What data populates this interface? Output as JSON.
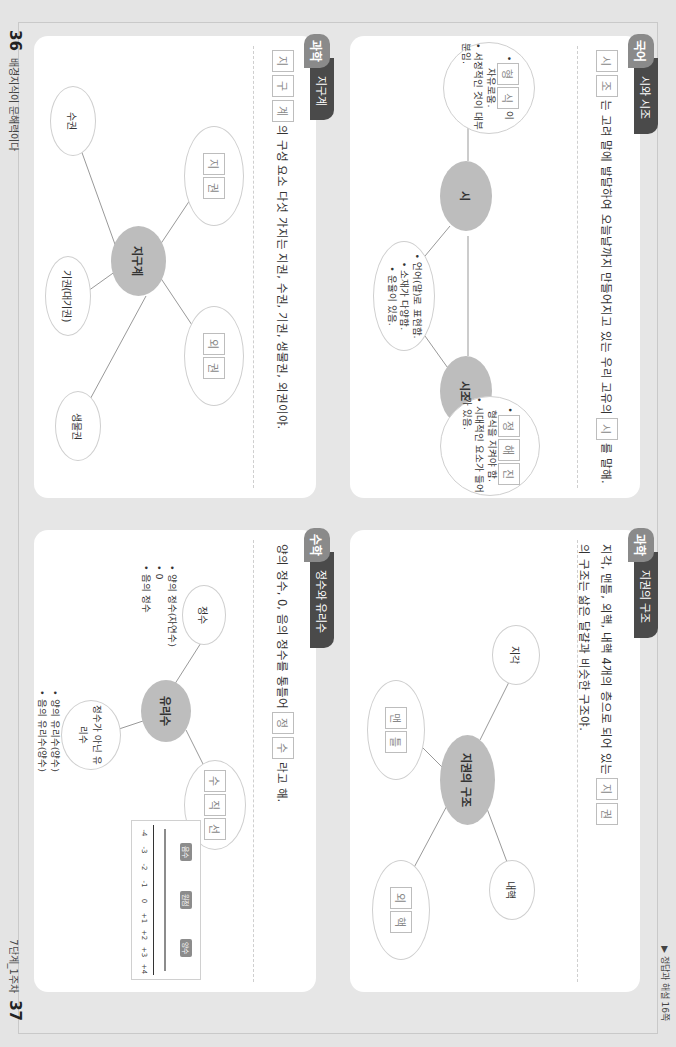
{
  "header": {
    "answer_ref": "▶ 정답과 해설 16쪽"
  },
  "footer": {
    "left_page_number": "36",
    "left_book_title": "배경지식이 문해력이다",
    "right_page_number": "37",
    "right_unit": "7단계_1주차"
  },
  "colors": {
    "korean_tab": "#8a8a8a",
    "science_tab": "#8a8a8a",
    "math_tab": "#8a8a8a",
    "title_tab": "#4a4a4a",
    "hub_fill": "#bdbdbd",
    "page_bg": "#e6e6e6"
  },
  "cards": {
    "poetry": {
      "subject": "국어",
      "title": "시와 시조",
      "prompt_boxes_pre": [
        "시",
        "조"
      ],
      "prompt_text_1": "는 고려 말에 발달하여 오늘날까지 만들어지고 있는 우리 고유의",
      "prompt_boxes_mid": [
        "시"
      ],
      "prompt_text_2": "를 말해.",
      "hubs": [
        "시",
        "시조"
      ],
      "poem_node": {
        "boxes": [
          "형",
          "식"
        ],
        "suffix": "이",
        "line1": "자유로움.",
        "line2": "• 서정적인 것이 대부분임."
      },
      "shared_node": {
        "line1": "• 언어(말)로 표현함.",
        "line2": "• 소재가 다양함.",
        "line3": "• 운율이 있음."
      },
      "sijo_node": {
        "boxes": [
          "정",
          "해",
          "진"
        ],
        "line1": "형식을 지켜야 함.",
        "line2": "• 시대적인 요소가 들어가 있음."
      }
    },
    "earth_system": {
      "subject": "과학",
      "title": "지구계",
      "prompt_boxes": [
        "지",
        "구",
        "계"
      ],
      "prompt_text": "의 구성 요소 다섯 가지는 지권, 수권, 기권, 생물권, 외권이야.",
      "hub": "지구계",
      "nodes": {
        "geosphere_boxes": [
          "지",
          "권"
        ],
        "outer_boxes": [
          "외",
          "권"
        ],
        "hydrosphere": "수권",
        "atmosphere": "기권(대기권)",
        "biosphere": "생물권"
      }
    },
    "geosphere": {
      "subject": "과학",
      "title": "지권의 구조",
      "prompt_text_1": "지각, 맨틀, 외핵, 내핵 4개의 층으로 되어 있는",
      "prompt_boxes": [
        "지",
        "권"
      ],
      "prompt_text_2": "의 구조는 삶은 달걀과 비슷한 구조야.",
      "hub": "지권의 구조",
      "nodes": {
        "crust": "지각",
        "mantle_boxes": [
          "맨",
          "틀"
        ],
        "inner_core": "내핵",
        "outer_core_boxes": [
          "외",
          "핵"
        ]
      }
    },
    "rational": {
      "subject": "수학",
      "title": "정수와 유리수",
      "prompt_text_1": "양의 정수, 0, 음의 정수를 통틀어",
      "prompt_boxes": [
        "정",
        "수"
      ],
      "prompt_text_2": "라고 해.",
      "hub": "유리수",
      "nodes": {
        "integer": "정수",
        "integer_list": [
          "• 양의 정수(자연수)",
          "• 0",
          "• 음의 정수"
        ],
        "non_integer": "정수가 아닌 유리수",
        "non_integer_list": [
          "• 양의 유리수(양수)",
          "• 음의 유리수(양수)"
        ],
        "number_line_boxes": [
          "수",
          "직",
          "선"
        ]
      },
      "number_line": {
        "ticks": [
          "-4",
          "-3",
          "-2",
          "-1",
          "0",
          "+1",
          "+2",
          "+3",
          "+4"
        ],
        "origin_label": "0",
        "labels": [
          "음수",
          "원점",
          "양수"
        ]
      }
    }
  }
}
